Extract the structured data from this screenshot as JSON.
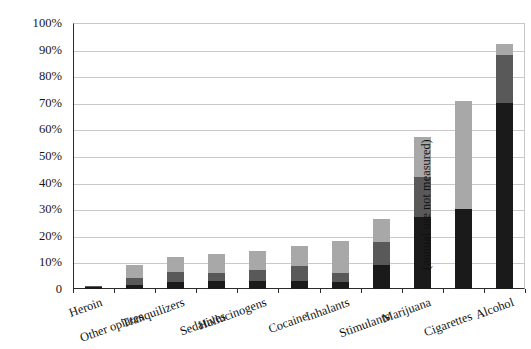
{
  "chart_data": {
    "type": "bar",
    "subtype": "stacked-bar",
    "title": "",
    "subtitle": "",
    "xlabel": "",
    "ylabel": "",
    "ylim": [
      0,
      100
    ],
    "ytick_labels": [
      "0",
      "10%",
      "20%",
      "30%",
      "40%",
      "50%",
      "60%",
      "70%",
      "80%",
      "90%",
      "100%"
    ],
    "ytick_values": [
      0,
      10,
      20,
      30,
      40,
      50,
      60,
      70,
      80,
      90,
      100
    ],
    "grid": true,
    "legend_position": "none",
    "categories": [
      "Heroin",
      "Other opiates",
      "Tranquilizers",
      "Sedatives",
      "Hallucinogens",
      "Cocaine",
      "Inhalants",
      "Stimulants",
      "Marijuana",
      "Cigarettes",
      "Alcohol"
    ],
    "series": [
      {
        "name": "past-month use",
        "color": "#1a1a1a",
        "values": [
          0.8,
          1.5,
          2.5,
          3.0,
          3.0,
          3.0,
          2.5,
          9.0,
          27.0,
          30.0,
          70.0
        ]
      },
      {
        "name": "annual use",
        "color": "#595959",
        "values": [
          0.2,
          2.5,
          4.0,
          3.2,
          4.2,
          5.5,
          3.5,
          8.5,
          15.0,
          0,
          18.0
        ]
      },
      {
        "name": "lifetime use",
        "color": "#a8a8a8",
        "values": [
          0.2,
          5.0,
          5.7,
          7.0,
          7.0,
          7.5,
          12.2,
          9.0,
          15.0,
          40.5,
          4.0
        ]
      }
    ],
    "cumulative_totals": [
      1.2,
      9.0,
      12.2,
      13.2,
      14.2,
      16.0,
      18.2,
      26.5,
      57.0,
      70.5,
      92.0
    ],
    "annotations": [
      {
        "text": "(annual use not measured)",
        "attached_to": "Cigarettes",
        "orientation": "vertical"
      }
    ],
    "colors": {
      "segment_low": "#1a1a1a",
      "segment_mid": "#595959",
      "segment_high": "#a8a8a8",
      "axis": "#2b2b2b",
      "gridline": "#c9c9c9",
      "background": "#ffffff",
      "text": "#121212"
    }
  }
}
